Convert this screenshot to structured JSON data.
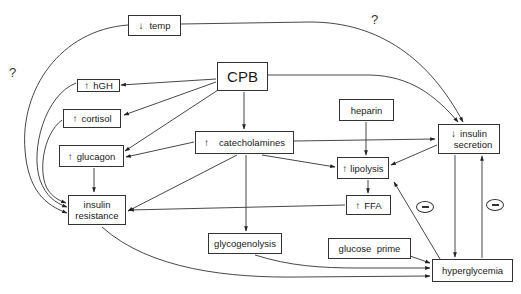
{
  "nodes": {
    "temp": {
      "arrow": "↓",
      "label": "temp"
    },
    "hgh": {
      "arrow": "↑",
      "label": "hGH"
    },
    "cpb": {
      "label": "CPB"
    },
    "cortisol": {
      "arrow": "↑",
      "label": "cortisol"
    },
    "catecholamines": {
      "arrow": "↑",
      "label": "catecholamines"
    },
    "heparin": {
      "label": "heparin"
    },
    "insulin_secretion": {
      "arrow": "↓",
      "line1": "insulin",
      "line2": "secretion"
    },
    "glucagon": {
      "arrow": "↑",
      "label": "glucagon"
    },
    "lipolysis": {
      "arrow": "↑",
      "label": "lipolysis"
    },
    "ffa": {
      "arrow": "↑",
      "label": "FFA"
    },
    "insulin_resistance": {
      "line1": "insulin",
      "line2": "resistance"
    },
    "glycogenolysis": {
      "label": "glycogenolysis"
    },
    "glucose_prime": {
      "label": "glucose  prime"
    },
    "hyperglycemia": {
      "label": "hyperglycemia"
    }
  },
  "annotations": {
    "question_left": "?",
    "question_top": "?",
    "negative_feedback_symbol": "minus-in-circle"
  },
  "edges": [
    {
      "from": "temp",
      "to": "insulin_resistance",
      "label": "?"
    },
    {
      "from": "temp",
      "to": "insulin_secretion",
      "label": "?"
    },
    {
      "from": "cpb",
      "to": "hgh"
    },
    {
      "from": "cpb",
      "to": "cortisol"
    },
    {
      "from": "cpb",
      "to": "glucagon"
    },
    {
      "from": "cpb",
      "to": "catecholamines"
    },
    {
      "from": "cpb",
      "to": "insulin_secretion"
    },
    {
      "from": "hgh",
      "to": "insulin_resistance"
    },
    {
      "from": "cortisol",
      "to": "insulin_resistance"
    },
    {
      "from": "glucagon",
      "to": "insulin_resistance"
    },
    {
      "from": "catecholamines",
      "to": "glucagon"
    },
    {
      "from": "catecholamines",
      "to": "insulin_resistance"
    },
    {
      "from": "catecholamines",
      "to": "lipolysis"
    },
    {
      "from": "catecholamines",
      "to": "insulin_secretion"
    },
    {
      "from": "catecholamines",
      "to": "glycogenolysis"
    },
    {
      "from": "catecholamines",
      "to": "hyperglycemia"
    },
    {
      "from": "heparin",
      "to": "lipolysis"
    },
    {
      "from": "insulin_secretion",
      "to": "lipolysis"
    },
    {
      "from": "insulin_secretion",
      "to": "hyperglycemia"
    },
    {
      "from": "lipolysis",
      "to": "ffa"
    },
    {
      "from": "ffa",
      "to": "insulin_resistance"
    },
    {
      "from": "insulin_resistance",
      "to": "hyperglycemia"
    },
    {
      "from": "glycogenolysis",
      "to": "hyperglycemia"
    },
    {
      "from": "glucose_prime",
      "to": "hyperglycemia"
    },
    {
      "from": "hyperglycemia",
      "to": "lipolysis",
      "label": "negative"
    },
    {
      "from": "hyperglycemia",
      "to": "insulin_secretion",
      "label": "negative"
    }
  ]
}
